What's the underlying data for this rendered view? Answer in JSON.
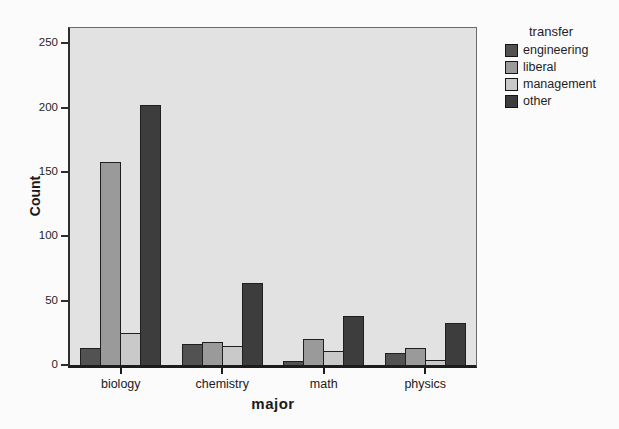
{
  "chart_data": {
    "type": "bar",
    "title": "",
    "categories": [
      "biology",
      "chemistry",
      "math",
      "physics"
    ],
    "series": [
      {
        "name": "engineering",
        "color": "#525252",
        "values": [
          13,
          16,
          3,
          9
        ]
      },
      {
        "name": "liberal",
        "color": "#9a9a9a",
        "values": [
          158,
          18,
          20,
          13
        ]
      },
      {
        "name": "management",
        "color": "#c9c9c9",
        "values": [
          25,
          15,
          11,
          4
        ]
      },
      {
        "name": "other",
        "color": "#3d3d3d",
        "values": [
          202,
          64,
          38,
          33
        ]
      }
    ],
    "xlabel": "major",
    "ylabel": "Count",
    "ylim": [
      0,
      262
    ],
    "yticks": [
      0,
      50,
      100,
      150,
      200,
      250
    ],
    "legend_title": "transfer",
    "legend_position": "right",
    "grid": false,
    "plot_background": "#e2e2e2",
    "figure_background": "#fbfbfb",
    "axis_color": "#1c1c1c"
  }
}
